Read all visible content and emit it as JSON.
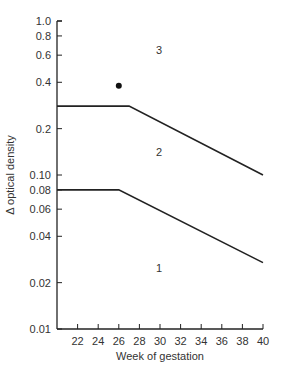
{
  "chart_data": {
    "type": "line",
    "title": "",
    "xlabel": "Week of gestation",
    "ylabel": "Δ optical density",
    "yscale": "log",
    "xlim": [
      20,
      40
    ],
    "ylim": [
      0.01,
      1.0
    ],
    "grid": false,
    "x_ticks": [
      22,
      24,
      26,
      28,
      30,
      32,
      34,
      36,
      38,
      40
    ],
    "y_ticks": [
      {
        "value": 1.0,
        "label": "1.0"
      },
      {
        "value": 0.8,
        "label": "0.8"
      },
      {
        "value": 0.6,
        "label": "0.6"
      },
      {
        "value": 0.4,
        "label": "0.4"
      },
      {
        "value": 0.2,
        "label": "0.2"
      },
      {
        "value": 0.1,
        "label": "0.10"
      },
      {
        "value": 0.08,
        "label": "0.08"
      },
      {
        "value": 0.06,
        "label": "0.06"
      },
      {
        "value": 0.04,
        "label": "0.04"
      },
      {
        "value": 0.02,
        "label": "0.02"
      },
      {
        "value": 0.01,
        "label": "0.01"
      }
    ],
    "series": [
      {
        "name": "Upper boundary (zone 2/3)",
        "x": [
          20,
          27,
          40
        ],
        "y": [
          0.28,
          0.28,
          0.1
        ]
      },
      {
        "name": "Lower boundary (zone 1/2)",
        "x": [
          20,
          26,
          40
        ],
        "y": [
          0.08,
          0.08,
          0.027
        ]
      }
    ],
    "points": [
      {
        "x": 26,
        "y": 0.38
      }
    ],
    "annotations": [
      {
        "text": "3",
        "x": 30,
        "y": 0.65
      },
      {
        "text": "2",
        "x": 30,
        "y": 0.14
      },
      {
        "text": "1",
        "x": 30,
        "y": 0.025
      }
    ]
  }
}
